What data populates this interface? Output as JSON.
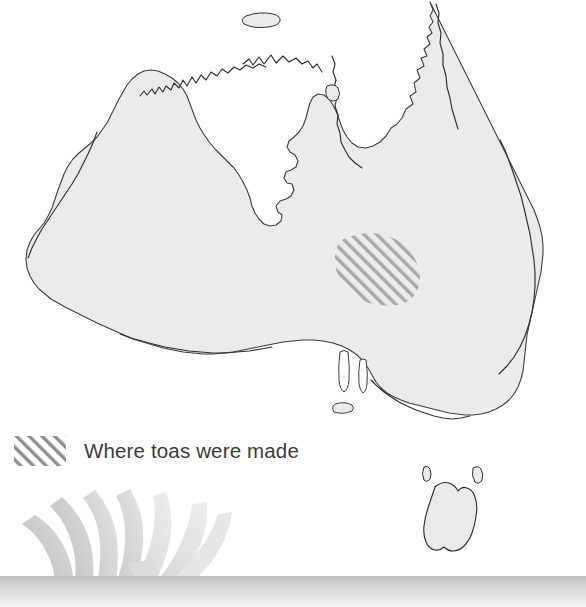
{
  "figure": {
    "kind": "thematic-map",
    "region": "Australia",
    "background_color": "#ffffff"
  },
  "map": {
    "land_fill": "#ebebeb",
    "coast_stroke": "#3c3c3c",
    "highlight_label": "Where toas were made",
    "highlight_fill": "#a8a8a8",
    "highlight_pattern": "diagonal-hatch"
  },
  "legend": {
    "swatch_name": "diagonal-hatch-swatch",
    "label": "Where toas were made",
    "text_color": "#3a3a3c"
  },
  "decoration": {
    "motif": "feather-fan",
    "blade_color_light": "#e3e3e3",
    "blade_color_mid": "#c9c9c9",
    "blade_color_dark": "#bdbdbd",
    "band_color_top": "#c2c2c2",
    "band_color_bottom": "#f3f3f3"
  }
}
